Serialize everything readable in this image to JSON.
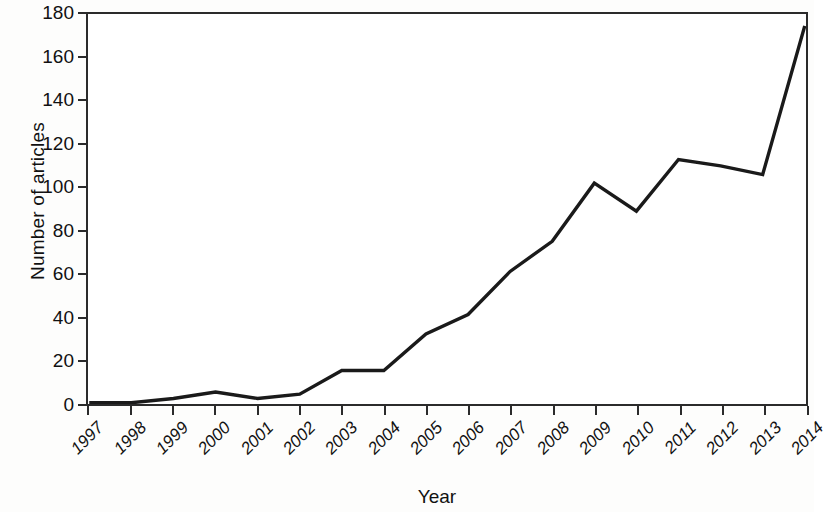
{
  "chart_data": {
    "type": "line",
    "title": "",
    "subtitle": "",
    "xlabel": "Year",
    "ylabel": "Number of articles",
    "categories": [
      "1997",
      "1998",
      "1999",
      "2000",
      "2001",
      "2002",
      "2003",
      "2004",
      "2005",
      "2006",
      "2007",
      "2008",
      "2009",
      "2010",
      "2011",
      "2012",
      "2013",
      "2014"
    ],
    "x": [
      1997,
      1998,
      1999,
      2000,
      2001,
      2002,
      2003,
      2004,
      2005,
      2006,
      2007,
      2008,
      2009,
      2010,
      2011,
      2012,
      2013,
      2014
    ],
    "values": [
      0,
      0,
      2,
      5,
      2,
      4,
      15,
      15,
      32,
      41,
      61,
      75,
      102,
      89,
      113,
      110,
      106,
      175
    ],
    "series": [
      {
        "name": "Number of articles",
        "values": [
          0,
          0,
          2,
          5,
          2,
          4,
          15,
          15,
          32,
          41,
          61,
          75,
          102,
          89,
          113,
          110,
          106,
          175
        ],
        "color": "#1a1a1a"
      }
    ],
    "xlim": [
      1997,
      2014
    ],
    "ylim": [
      0,
      180
    ],
    "yticks": [
      0,
      20,
      40,
      60,
      80,
      100,
      120,
      140,
      160,
      180
    ],
    "ytick_labels": [
      "0",
      "20",
      "40",
      "60",
      "80",
      "100",
      "120",
      "140",
      "160",
      "180"
    ],
    "xticks": [
      1997,
      1998,
      1999,
      2000,
      2001,
      2002,
      2003,
      2004,
      2005,
      2006,
      2007,
      2008,
      2009,
      2010,
      2011,
      2012,
      2013,
      2014
    ],
    "xtick_labels": [
      "1997",
      "1998",
      "1999",
      "2000",
      "2001",
      "2002",
      "2003",
      "2004",
      "2005",
      "2006",
      "2007",
      "2008",
      "2009",
      "2010",
      "2011",
      "2012",
      "2013",
      "2014"
    ],
    "grid": false,
    "legend": false,
    "legend_position": "none",
    "line_width": 3,
    "markers": false,
    "axis_color": "#2b2b2b",
    "background_color": "#ffffff"
  },
  "axes": {
    "y_title": "Number of articles",
    "x_title": "Year"
  }
}
